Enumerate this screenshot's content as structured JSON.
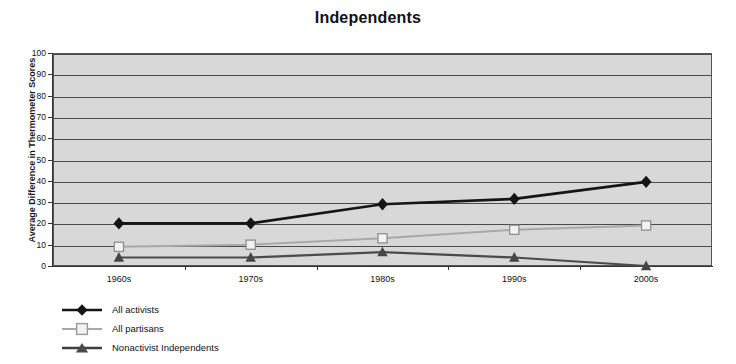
{
  "chart_data": {
    "type": "line",
    "title": "Independents",
    "xlabel": "",
    "ylabel": "Average Difference in Thermometer Scores",
    "categories": [
      "1960s",
      "1970s",
      "1980s",
      "1990s",
      "2000s"
    ],
    "ylim": [
      0,
      100
    ],
    "yticks": [
      0,
      10,
      20,
      30,
      40,
      50,
      60,
      70,
      80,
      90,
      100
    ],
    "grid": "horizontal",
    "legend_position": "bottom-left",
    "plot_background": "#d8d8d8",
    "series": [
      {
        "name": "All activists",
        "marker": "filled-diamond",
        "color": "#151515",
        "values": [
          20,
          20,
          29,
          31.5,
          39.5
        ]
      },
      {
        "name": "All partisans",
        "marker": "open-square",
        "color": "#a8a8a8",
        "values": [
          9,
          10,
          13,
          17,
          19
        ]
      },
      {
        "name": "Nonactivist Independents",
        "marker": "filled-triangle",
        "color": "#4a4a4a",
        "values": [
          4,
          4,
          6.5,
          4,
          0
        ]
      }
    ]
  },
  "ytick_labels": [
    "100",
    "90",
    "80",
    "70",
    "60",
    "50",
    "40",
    "30",
    "20",
    "10",
    "0"
  ],
  "legend": {
    "items": [
      {
        "label": "All activists"
      },
      {
        "label": "All partisans"
      },
      {
        "label": "Nonactivist Independents"
      }
    ]
  }
}
